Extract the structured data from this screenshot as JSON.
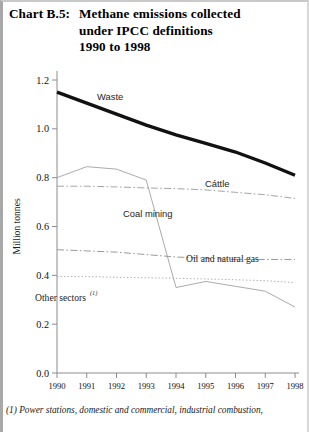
{
  "title": {
    "tag": "Chart B.5:",
    "line1": "Methane emissions collected",
    "line2": "under IPCC definitions",
    "line3": "1990 to 1998"
  },
  "footnote": {
    "text": "(1) Power stations, domestic and commercial, industrial combustion,"
  },
  "labels": {
    "waste": "Waste",
    "cattle": "Cáttle",
    "coal": "Coal mining",
    "oil": "Oil and natural gas",
    "other": "Other sectors",
    "other_sup": "(1)"
  },
  "colors": {
    "waste": "#111111",
    "cattle": "#9a9a9a",
    "coal": "#a0a0a0",
    "oil": "#8d8d8d",
    "other": "#a6a6a6",
    "axis": "#8c8c8c",
    "text": "#111111"
  },
  "chart_data": {
    "type": "line",
    "title": "Methane emissions collected under IPCC definitions 1990 to 1998",
    "xlabel": "",
    "ylabel": "Million tonnes",
    "x": [
      1990,
      1991,
      1992,
      1993,
      1994,
      1995,
      1996,
      1997,
      1998
    ],
    "xtick_labels": [
      "1990",
      "1991",
      "1992",
      "1993",
      "1994",
      "1995",
      "1996",
      "1997",
      "1998"
    ],
    "ytick_labels": [
      "0.0",
      "0.2",
      "0.4",
      "0.6",
      "0.8",
      "1.0",
      "1.2"
    ],
    "ylim": [
      0.0,
      1.2
    ],
    "ytick_step": 0.2,
    "grid": false,
    "legend": "inline-annotations",
    "series": [
      {
        "name": "Waste",
        "style": "thick-solid",
        "values": [
          1.15,
          1.105,
          1.06,
          1.015,
          0.975,
          0.94,
          0.905,
          0.86,
          0.81
        ]
      },
      {
        "name": "Cáttle",
        "style": "dash-dot",
        "values": [
          0.765,
          0.765,
          0.762,
          0.758,
          0.755,
          0.75,
          0.74,
          0.73,
          0.715
        ]
      },
      {
        "name": "Coal mining",
        "style": "thin-solid",
        "values": [
          0.8,
          0.845,
          0.835,
          0.79,
          0.35,
          0.375,
          0.355,
          0.335,
          0.27
        ]
      },
      {
        "name": "Oil and natural gas",
        "style": "dash-dot",
        "values": [
          0.505,
          0.5,
          0.495,
          0.485,
          0.475,
          0.47,
          0.465,
          0.465,
          0.465
        ]
      },
      {
        "name": "Other sectors",
        "style": "dotted",
        "values": [
          0.395,
          0.395,
          0.392,
          0.39,
          0.388,
          0.385,
          0.382,
          0.378,
          0.37
        ]
      }
    ]
  }
}
